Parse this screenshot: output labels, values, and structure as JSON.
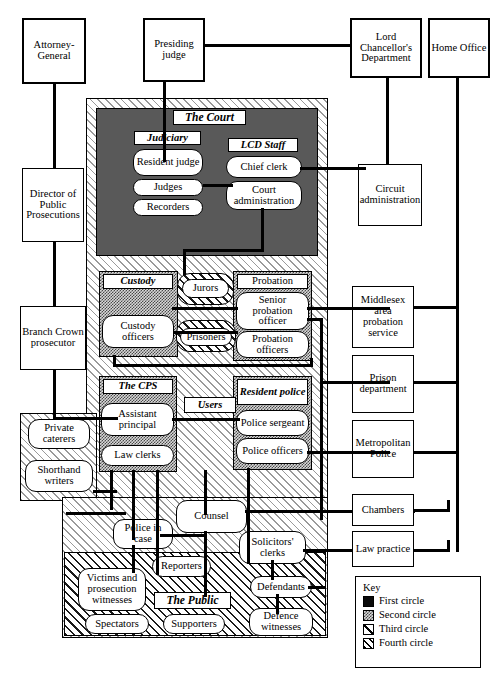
{
  "diagram": {
    "external_boxes": [
      {
        "id": "attorney_general",
        "label": "Attorney-General"
      },
      {
        "id": "presiding_judge",
        "label": "Presiding judge"
      },
      {
        "id": "lord_chancellors_department",
        "label": "Lord Chancellor's Department"
      },
      {
        "id": "home_office",
        "label": "Home Office"
      },
      {
        "id": "director_public_prosecutions",
        "label": "Director of Public Prosecutions"
      },
      {
        "id": "branch_crown_prosecutor",
        "label": "Branch Crown prosecutor"
      },
      {
        "id": "circuit_administration",
        "label": "Circuit administration"
      },
      {
        "id": "middlesex_area_probation_service",
        "label": "Middlesex area probation service"
      },
      {
        "id": "prison_department",
        "label": "Prison department"
      },
      {
        "id": "metropolitan_police",
        "label": "Metropolitan Police"
      },
      {
        "id": "chambers",
        "label": "Chambers"
      },
      {
        "id": "law_practice",
        "label": "Law practice"
      }
    ],
    "groups": [
      {
        "id": "the_court",
        "label": "The Court",
        "circle": "first"
      },
      {
        "id": "judiciary",
        "label": "Judiciary",
        "circle": "first"
      },
      {
        "id": "lcd_staff",
        "label": "LCD Staff",
        "circle": "second"
      },
      {
        "id": "custody",
        "label": "Custody",
        "circle": "second"
      },
      {
        "id": "probation",
        "label": "Probation",
        "circle": "second"
      },
      {
        "id": "the_cps",
        "label": "The CPS",
        "circle": "second"
      },
      {
        "id": "resident_police",
        "label": "Resident police",
        "circle": "second"
      },
      {
        "id": "users",
        "label": "Users",
        "circle": "second"
      },
      {
        "id": "the_public",
        "label": "The Public",
        "circle": "third"
      }
    ],
    "nodes": {
      "resident_judge": "Resident judge",
      "judges": "Judges",
      "recorders": "Recorders",
      "chief_clerk": "Chief clerk",
      "court_administration": "Court administration",
      "jurors": "Jurors",
      "custody_officers": "Custody officers",
      "prisoners": "Prisoners",
      "senior_probation_officer": "Senior probation officer",
      "probation_officers": "Probation officers",
      "assistant_principal": "Assistant principal",
      "law_clerks": "Law clerks",
      "police_sergeant": "Police sergeant",
      "police_officers": "Police officers",
      "private_caterers": "Private caterers",
      "shorthand_writers": "Shorthand writers",
      "counsel": "Counsel",
      "police_in_case": "Police in case",
      "solicitors_clerks": "Solicitors' clerks",
      "reporters": "Reporters",
      "victims_and_prosecution_witnesses": "Victims and prosecution witnesses",
      "defendants": "Defendants",
      "spectators": "Spectators",
      "supporters": "Supporters",
      "defence_witnesses": "Defence witnesses"
    },
    "legend": {
      "title": "Key",
      "items": [
        {
          "label": "First circle",
          "pattern": "solid-black"
        },
        {
          "label": "Second circle",
          "pattern": "checkerboard"
        },
        {
          "label": "Third circle",
          "pattern": "dense-diagonal-hatch"
        },
        {
          "label": "Fourth circle",
          "pattern": "sparse-diagonal-hatch"
        }
      ]
    },
    "colors": {
      "ink": "#000000",
      "court_panel": "#595959",
      "first_circle": "#0a0a0a",
      "second_circle": "#d8d8d8",
      "page": "#ffffff"
    }
  }
}
